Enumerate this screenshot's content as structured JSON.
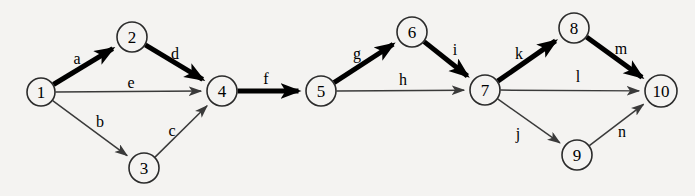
{
  "diagram": {
    "type": "directed-graph",
    "canvas": {
      "width": 695,
      "height": 196
    },
    "colors": {
      "background": "#f4f3f1",
      "node_fill": "#f4f3f1",
      "node_stroke": "#2b2b2b",
      "edge_thin": "#3a3a3a",
      "edge_bold": "#000000",
      "text": "#000000"
    },
    "nodes": [
      {
        "id": "1",
        "label": "1",
        "x": 41,
        "y": 92,
        "r": 14
      },
      {
        "id": "2",
        "label": "2",
        "x": 132,
        "y": 37,
        "r": 15
      },
      {
        "id": "3",
        "label": "3",
        "x": 144,
        "y": 168,
        "r": 15
      },
      {
        "id": "4",
        "label": "4",
        "x": 222,
        "y": 91,
        "r": 15
      },
      {
        "id": "5",
        "label": "5",
        "x": 321,
        "y": 91,
        "r": 15
      },
      {
        "id": "6",
        "label": "6",
        "x": 412,
        "y": 32,
        "r": 15
      },
      {
        "id": "7",
        "label": "7",
        "x": 485,
        "y": 90,
        "r": 15
      },
      {
        "id": "8",
        "label": "8",
        "x": 574,
        "y": 28,
        "r": 15
      },
      {
        "id": "9",
        "label": "9",
        "x": 577,
        "y": 155,
        "r": 15
      },
      {
        "id": "10",
        "label": "10",
        "x": 661,
        "y": 91,
        "r": 16
      }
    ],
    "edges": [
      {
        "id": "a",
        "label": "a",
        "from": "1",
        "to": "2",
        "style": "bold",
        "label_x": 77,
        "label_y": 58
      },
      {
        "id": "b",
        "label": "b",
        "from": "1",
        "to": "3",
        "style": "thin",
        "label_x": 100,
        "label_y": 121
      },
      {
        "id": "c",
        "label": "c",
        "from": "3",
        "to": "4",
        "style": "thin",
        "label_x": 172,
        "label_y": 130
      },
      {
        "id": "d",
        "label": "d",
        "from": "2",
        "to": "4",
        "style": "bold",
        "label_x": 175,
        "label_y": 53
      },
      {
        "id": "e",
        "label": "e",
        "from": "1",
        "to": "4",
        "style": "thin",
        "label_x": 131,
        "label_y": 82
      },
      {
        "id": "f",
        "label": "f",
        "from": "4",
        "to": "5",
        "style": "bold",
        "label_x": 266,
        "label_y": 78
      },
      {
        "id": "g",
        "label": "g",
        "from": "5",
        "to": "6",
        "style": "bold",
        "label_x": 357,
        "label_y": 53
      },
      {
        "id": "h",
        "label": "h",
        "from": "5",
        "to": "7",
        "style": "thin",
        "label_x": 403,
        "label_y": 79
      },
      {
        "id": "i",
        "label": "i",
        "from": "6",
        "to": "7",
        "style": "bold",
        "label_x": 455,
        "label_y": 49
      },
      {
        "id": "j",
        "label": "j",
        "from": "7",
        "to": "9",
        "style": "thin",
        "label_x": 518,
        "label_y": 133
      },
      {
        "id": "k",
        "label": "k",
        "from": "7",
        "to": "8",
        "style": "bold",
        "label_x": 519,
        "label_y": 53
      },
      {
        "id": "l",
        "label": "l",
        "from": "7",
        "to": "10",
        "style": "thin",
        "label_x": 578,
        "label_y": 76
      },
      {
        "id": "m",
        "label": "m",
        "from": "8",
        "to": "10",
        "style": "bold",
        "label_x": 621,
        "label_y": 48
      },
      {
        "id": "n",
        "label": "n",
        "from": "9",
        "to": "10",
        "style": "thin",
        "label_x": 622,
        "label_y": 131
      }
    ]
  }
}
